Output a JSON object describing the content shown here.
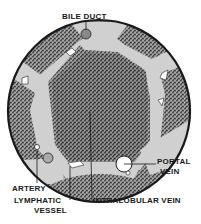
{
  "diagram": {
    "labels": {
      "bile_duct": "BILE DUCT",
      "portal_vein_line1": "PORTAL",
      "portal_vein_line2": "VEIN",
      "artery": "ARTERY",
      "lymphatic_line1": "LYMPHATIC",
      "lymphatic_line2": "VESSEL",
      "intralobular_vein": "INTRALOBULAR VEIN"
    },
    "colors": {
      "outline": "#1a1a1a",
      "tissue": "#6e6e6e",
      "connective": "#d0d0d0",
      "background": "#ffffff"
    }
  }
}
